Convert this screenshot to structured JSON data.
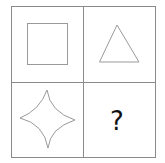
{
  "puzzle": {
    "grid": {
      "rows": 2,
      "cols": 2,
      "line_color": "#8a8a8a",
      "shape_color": "#9a9a9a"
    },
    "cells": [
      {
        "position": "top-left",
        "shape": "square"
      },
      {
        "position": "top-right",
        "shape": "triangle"
      },
      {
        "position": "bottom-left",
        "shape": "four-point-concave-star"
      },
      {
        "position": "bottom-right",
        "shape": "unknown",
        "label": "?"
      }
    ]
  }
}
